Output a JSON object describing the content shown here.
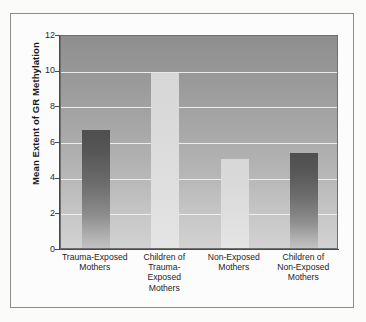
{
  "figure": {
    "background_color": "#fbfbfa",
    "frame_color": "#8b8b8b"
  },
  "chart_data": {
    "type": "bar",
    "title": "",
    "subtitle": "",
    "xlabel": "",
    "ylabel": "Mean Extent of GR Methylation",
    "ylim": [
      0,
      12
    ],
    "yticks": [
      "0",
      "2",
      "4",
      "6",
      "8",
      "10",
      "12"
    ],
    "ytick_values": [
      0,
      2,
      4,
      6,
      8,
      10,
      12
    ],
    "grid": "horizontal",
    "gridline_color": "#f2f2f2",
    "legend": "none",
    "categories": [
      "Trauma-Exposed Mothers",
      "Children of Trauma-Exposed Mothers",
      "Non-Exposed Mothers",
      "Children of Non-Exposed Mothers"
    ],
    "category_lines": [
      [
        "Trauma-Exposed",
        "Mothers"
      ],
      [
        "Children of",
        "Trauma-",
        "Exposed",
        "Mothers"
      ],
      [
        "Non-Exposed",
        "Mothers"
      ],
      [
        "Children of",
        "Non-Exposed",
        "Mothers"
      ]
    ],
    "values": [
      6.6,
      9.8,
      5.0,
      5.3
    ],
    "bar_styles": [
      "dark",
      "light",
      "light",
      "dark"
    ],
    "bar_colors": {
      "dark_top": "#4f4f4f",
      "dark_bottom": "#c2c2c2",
      "light_top": "#d7d7d7",
      "light_bottom": "#e4e4e4"
    },
    "plot_background": {
      "top": "#8e8e8e",
      "bottom": "#d2d2d2"
    }
  }
}
